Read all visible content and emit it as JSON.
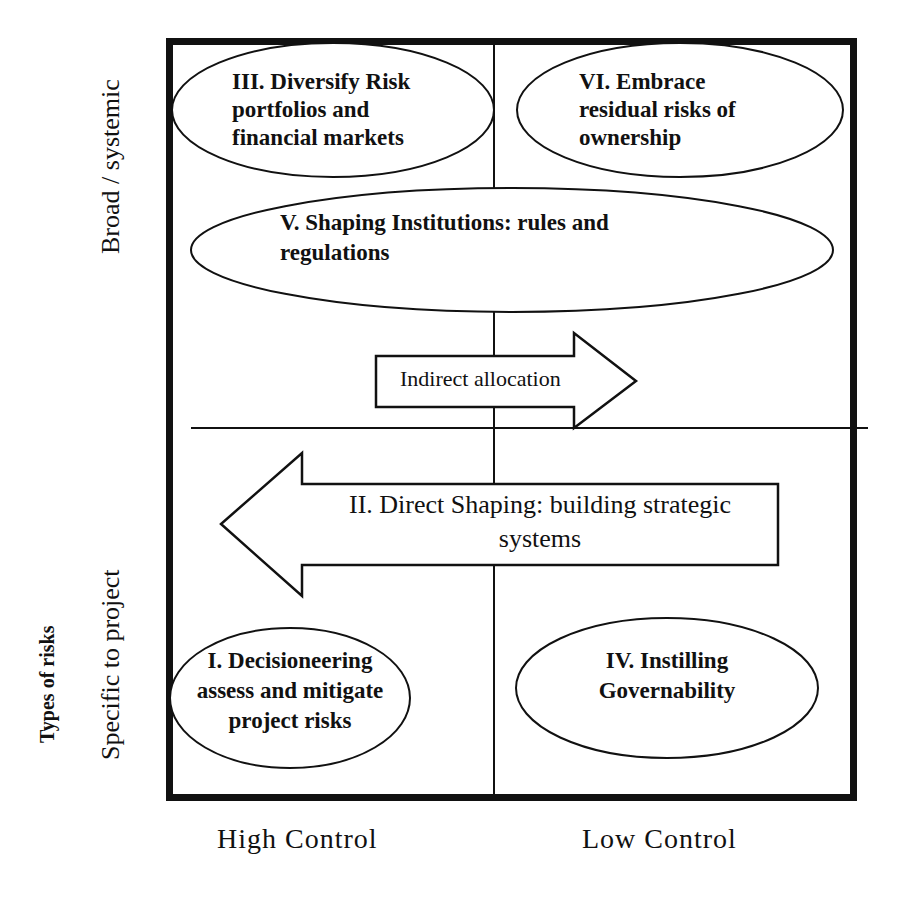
{
  "diagram": {
    "axes": {
      "y_title": "Types of risks",
      "y_top_label": "Broad / systemic",
      "y_bottom_label": "Specific to project",
      "x_left_label": "High Control",
      "x_right_label": "Low Control"
    },
    "ellipses": {
      "III": {
        "line1": "III. Diversify Risk",
        "line2": "portfolios and",
        "line3": "financial markets"
      },
      "VI": {
        "line1": "VI. Embrace",
        "line2": "residual risks of",
        "line3": "ownership"
      },
      "V": {
        "line1": "V. Shaping Institutions: rules and",
        "line2": "regulations"
      },
      "I": {
        "line1": "I. Decisioneering",
        "line2": "assess and mitigate",
        "line3": "project risks"
      },
      "IV": {
        "line1": "IV. Instilling",
        "line2": "Governability"
      }
    },
    "arrows": {
      "indirect": {
        "label": "Indirect allocation",
        "direction": "right"
      },
      "direct": {
        "line1": "II. Direct Shaping: building strategic",
        "line2": "systems",
        "direction": "left"
      }
    },
    "colors": {
      "stroke": "#111111",
      "background": "#ffffff"
    }
  }
}
